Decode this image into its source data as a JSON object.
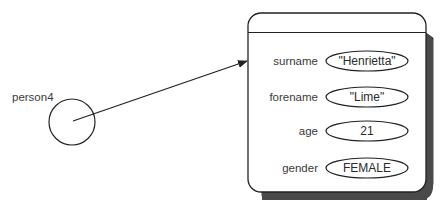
{
  "diagram": {
    "variable": {
      "name": "person4"
    },
    "object": {
      "fields": [
        {
          "label": "surname",
          "value": "\"Henrietta\""
        },
        {
          "label": "forename",
          "value": "\"Lime\""
        },
        {
          "label": "age",
          "value": "21"
        },
        {
          "label": "gender",
          "value": "FEMALE"
        }
      ]
    },
    "colors": {
      "stroke": "#222222",
      "shadow": "#4a4a4a",
      "text": "#3a3a3a"
    }
  }
}
